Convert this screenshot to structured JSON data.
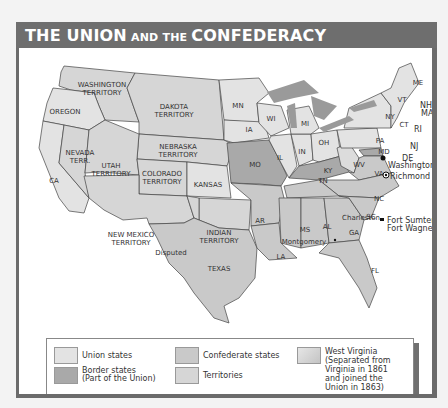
{
  "title": {
    "part1": "THE UNION",
    "part2": " AND THE ",
    "part3": "CONFEDERACY"
  },
  "colors": {
    "union": "#e3e3e3",
    "border": "#a9a9a9",
    "confederate": "#c9c9c9",
    "territory": "#d6d6d6",
    "west_virginia": "#dcdcdc",
    "lakes": "#9a9a9a",
    "header": "#6e6e6e"
  },
  "map_labels": {
    "washington_territory": [
      "WASHINGTON",
      "TERRITORY"
    ],
    "oregon": "OREGON",
    "dakota_territory": [
      "DAKOTA",
      "TERRITORY"
    ],
    "nebraska_territory": [
      "NEBRASKA",
      "TERRITORY"
    ],
    "nevada_terr": [
      "NEVADA",
      "TERR."
    ],
    "utah_territory": [
      "UTAH",
      "TERRITORY"
    ],
    "colorado_territory": [
      "COLORADO",
      "TERRITORY"
    ],
    "ca": "CA",
    "kansas": "KANSAS",
    "new_mexico_territory": [
      "NEW MEXICO",
      "TERRITORY"
    ],
    "indian_territory": [
      "INDIAN",
      "TERRITORY"
    ],
    "disputed": "Disputed",
    "texas": "TEXAS",
    "mn": "MN",
    "wi": "WI",
    "mi": "MI",
    "ia": "IA",
    "il": "IL",
    "in": "IN",
    "oh": "OH",
    "mo": "MO",
    "ky": "KY",
    "ar": "AR",
    "tn": "TN",
    "ms": "MS",
    "al": "AL",
    "la": "LA",
    "ga": "GA",
    "fl": "FL",
    "sc": "SC",
    "nc": "NC",
    "va": "VA",
    "wv": "WV",
    "pa": "PA",
    "ny": "NY",
    "md": "MD",
    "de": "DE",
    "nj": "NJ",
    "me": "ME",
    "vt": "VT",
    "nh": "NH",
    "ma": "MA",
    "ct": "CT",
    "ri": "RI"
  },
  "cities": {
    "washington": "Washington",
    "richmond": "Richmond",
    "charleston": "Charleston",
    "montgomery": "Montgomery",
    "fort_sumter": "Fort Sumter",
    "fort_wagner": "Fort Wagner"
  },
  "legend": {
    "items": [
      {
        "label": "Union states"
      },
      {
        "label": "Border states\n(Part of the Union)",
        "line1": "Border states",
        "line2": "(Part of the Union)"
      },
      {
        "label": "Confederate states"
      },
      {
        "label": "Territories"
      },
      {
        "label": "West Virginia",
        "lines": [
          "West Virginia",
          "(Separated from",
          "Virginia in 1861",
          "and joined the",
          "Union in 1863)"
        ]
      }
    ]
  }
}
